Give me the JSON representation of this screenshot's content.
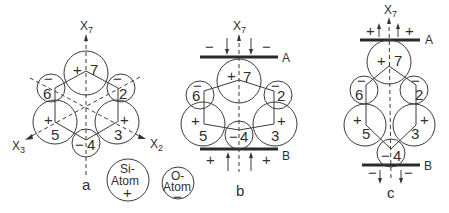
{
  "figure": {
    "panels": [
      {
        "id": "a",
        "label": "a",
        "axes": {
          "x7": {
            "base": "X",
            "sub": "7"
          },
          "x3": {
            "base": "X",
            "sub": "3"
          },
          "x2": {
            "base": "X",
            "sub": "2"
          }
        },
        "atoms": [
          {
            "n": "7",
            "sign": "+"
          },
          {
            "n": "6",
            "sign": "−"
          },
          {
            "n": "2",
            "sign": "−"
          },
          {
            "n": "5",
            "sign": "+"
          },
          {
            "n": "3",
            "sign": "+"
          },
          {
            "n": "4",
            "sign": "−"
          }
        ]
      },
      {
        "id": "b",
        "label": "b",
        "axis": {
          "base": "X",
          "sub": "7"
        },
        "plate_a": {
          "label": "A",
          "signs": [
            "−",
            "−"
          ]
        },
        "plate_b": {
          "label": "B",
          "signs": [
            "+",
            "+"
          ]
        },
        "atoms": [
          {
            "n": "7",
            "sign": "+"
          },
          {
            "n": "6",
            "sign": "−"
          },
          {
            "n": "2",
            "sign": "−"
          },
          {
            "n": "5",
            "sign": "+"
          },
          {
            "n": "3",
            "sign": "+"
          },
          {
            "n": "4",
            "sign": "−"
          }
        ]
      },
      {
        "id": "c",
        "label": "c",
        "axis": {
          "base": "X",
          "sub": "7"
        },
        "plate_a": {
          "label": "A",
          "signs": [
            "+",
            "+"
          ]
        },
        "plate_b": {
          "label": "B",
          "signs": [
            "−",
            "−"
          ]
        },
        "atoms": [
          {
            "n": "7",
            "sign": "+"
          },
          {
            "n": "6",
            "sign": "−"
          },
          {
            "n": "2",
            "sign": "−"
          },
          {
            "n": "5",
            "sign": "+"
          },
          {
            "n": "3",
            "sign": "+"
          },
          {
            "n": "4",
            "sign": "−"
          }
        ]
      }
    ],
    "legend": {
      "si_atom": {
        "line1": "Si-",
        "line2": "Atom",
        "sign": "+"
      },
      "o_atom": {
        "line1": "O-",
        "line2": "Atom",
        "sign": "−"
      }
    }
  }
}
